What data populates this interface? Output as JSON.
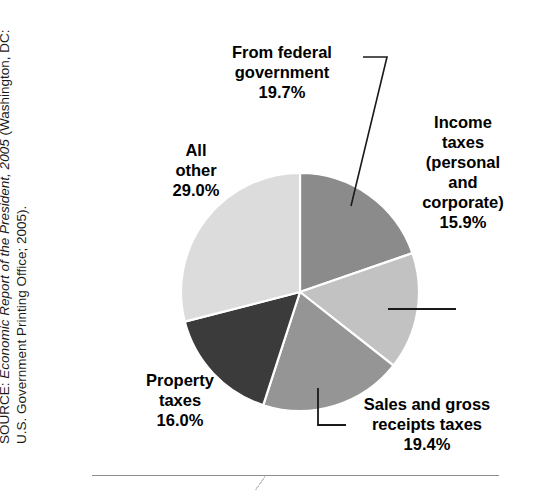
{
  "source": {
    "prefix": "SOURCE: ",
    "italic_title": "Economic Report of the President, 2005",
    "suffix": " (Washington, DC: U.S. Government Printing Office; 2005)."
  },
  "chart_data": {
    "type": "pie",
    "title": "",
    "subtitle": "",
    "xlabel": "",
    "ylabel": "",
    "legend_position": "none",
    "grid": false,
    "unit": "%",
    "start_angle_deg": 0,
    "direction": "clockwise",
    "categories": [
      "From federal government",
      "Income taxes (personal and corporate)",
      "Sales and gross receipts taxes",
      "Property taxes",
      "All other"
    ],
    "values": [
      19.7,
      15.9,
      19.4,
      16.0,
      29.0
    ],
    "slices": [
      {
        "name": "From federal government",
        "label_lines": "From federal\ngovernment\n19.7%",
        "value": 19.7,
        "value_text": "19.7%",
        "color": "#8b8b8b"
      },
      {
        "name": "Income taxes (personal and corporate)",
        "label_lines": "Income\ntaxes\n(personal\nand\ncorporate)\n15.9%",
        "value": 15.9,
        "value_text": "15.9%",
        "color": "#c2c2c2"
      },
      {
        "name": "Sales and gross receipts taxes",
        "label_lines": "Sales and gross\nreceipts taxes\n19.4%",
        "value": 19.4,
        "value_text": "19.4%",
        "color": "#959595"
      },
      {
        "name": "Property taxes",
        "label_lines": "Property\ntaxes\n16.0%",
        "value": 16.0,
        "value_text": "16.0%",
        "color": "#3b3b3b"
      },
      {
        "name": "All other",
        "label_lines": "All\nother\n29.0%",
        "value": 29.0,
        "value_text": "29.0%",
        "color": "#dcdcdc"
      }
    ],
    "slice_border_color": "#ffffff",
    "label_color": "#000000",
    "leader_line_color": "#1a1a1a",
    "background": "#ffffff"
  }
}
